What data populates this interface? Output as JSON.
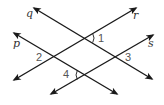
{
  "diagram": {
    "type": "intersecting-lines",
    "colors": {
      "line": "#1a1a1a",
      "line_label": "#333333",
      "angle_label": "#555555",
      "background": "#ffffff"
    },
    "lines": [
      {
        "name": "q",
        "label": "q",
        "from": [
          34,
          8
        ],
        "to": [
          152,
          79
        ],
        "label_pos": [
          26,
          17
        ]
      },
      {
        "name": "r",
        "label": "r",
        "from": [
          136,
          8
        ],
        "to": [
          14,
          80
        ],
        "label_pos": [
          133,
          19
        ]
      },
      {
        "name": "p",
        "label": "p",
        "from": [
          14,
          33
        ],
        "to": [
          117,
          94
        ],
        "label_pos": [
          13,
          47
        ]
      },
      {
        "name": "s",
        "label": "s",
        "from": [
          153,
          35
        ],
        "to": [
          51,
          94
        ],
        "label_pos": [
          148,
          47
        ]
      }
    ],
    "angles": [
      {
        "label": "1",
        "vertex": [
          85,
          38
        ],
        "lines": [
          "q",
          "r"
        ],
        "side": "right",
        "label_pos": [
          98,
          42
        ]
      },
      {
        "label": "2",
        "vertex": [
          54,
          57
        ],
        "lines": [
          "p",
          "r"
        ],
        "side": "left",
        "label_pos": [
          36,
          61
        ]
      },
      {
        "label": "3",
        "vertex": [
          116,
          57
        ],
        "lines": [
          "q",
          "s"
        ],
        "side": "right",
        "label_pos": [
          125,
          61
        ]
      },
      {
        "label": "4",
        "vertex": [
          85,
          75
        ],
        "lines": [
          "p",
          "s"
        ],
        "side": "left",
        "label_pos": [
          63,
          78
        ]
      }
    ]
  }
}
